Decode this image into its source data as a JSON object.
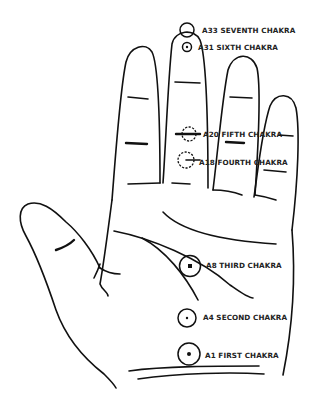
{
  "diagram": {
    "chakras": [
      {
        "code": "A33",
        "name": "SEVENTH CHAKRA",
        "label": "A33 SEVENTH CHAKRA"
      },
      {
        "code": "A31",
        "name": "SIXTH CHAKRA",
        "label": "A31 SIXTH CHAKRA"
      },
      {
        "code": "A20",
        "name": "FIFTH CHAKRA",
        "label": "A20 FIFTH CHAKRA"
      },
      {
        "code": "A18",
        "name": "FOURTH CHAKRA",
        "label": "A18 FOURTH CHAKRA"
      },
      {
        "code": "A8",
        "name": "THIRD CHAKRA",
        "label": "A8 THIRD CHAKRA"
      },
      {
        "code": "A4",
        "name": "SECOND CHAKRA",
        "label": "A4 SECOND CHAKRA"
      },
      {
        "code": "A1",
        "name": "FIRST CHAKRA",
        "label": "A1 FIRST CHAKRA"
      }
    ],
    "colors": {
      "ink": "#111111",
      "background": "#ffffff"
    }
  }
}
